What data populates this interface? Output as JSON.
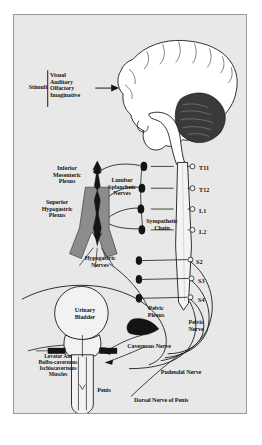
{
  "figure": {
    "background_color": "#e8e8e8",
    "border_color": "#9a9a9a",
    "ink_color": "#171717",
    "plexus_fill": "#8c8c8c",
    "dark_fill": "#141414"
  },
  "labels": {
    "stimuli": "Stimuli",
    "stimuli_list": "Visual\nAuditory\nOlfactory\nImaginative",
    "inferior_mesenteric_plexus": "Inferior\nMesenteric\nPlexus",
    "lumbar_splanchnic_nerves": "Lumbar\nSplanchnic\nNerves",
    "superior_hypogastric_plexus": "Superior\nHypogastric\nPlexus",
    "sympathetic_chain": "Sympathetic\nChain",
    "hypogastric_nerves": "Hypogastric\nNerves",
    "urinary_bladder": "Urinary\nBladder",
    "pelvic_plexus": "Pelvic\nPlexus",
    "pelvic_nerve": "Pelvic\nNerve",
    "cavernous_nerve": "Cavernous Nerve",
    "perineal_muscles": "Levator Ani\nBulbo-cavernous\nIschiocavernous\nMuscles",
    "penis": "Penis",
    "pudendal_nerve": "Pudendal Nerve",
    "dorsal_nerve_of_penis": "Dorsal Nerve of Penis"
  },
  "spinal_segments": [
    {
      "id": "T11",
      "label": "T11",
      "y": 152
    },
    {
      "id": "T12",
      "label": "T12",
      "y": 174
    },
    {
      "id": "L1",
      "label": "L1",
      "y": 195
    },
    {
      "id": "L2",
      "label": "L2",
      "y": 216
    },
    {
      "id": "S2",
      "label": "S2",
      "y": 246
    },
    {
      "id": "S3",
      "label": "S3",
      "y": 265
    },
    {
      "id": "S4",
      "label": "S4",
      "y": 284
    }
  ],
  "anatomy_parts": [
    "brain",
    "cerebellum",
    "brainstem",
    "spinal-cord",
    "sympathetic-ganglia",
    "inferior-mesenteric-plexus",
    "superior-hypogastric-plexus",
    "hypogastric-nerves",
    "pelvic-plexus",
    "urinary-bladder",
    "prostate",
    "penis",
    "perineal-muscles"
  ]
}
